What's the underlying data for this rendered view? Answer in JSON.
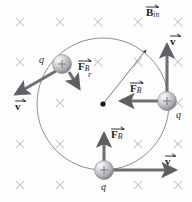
{
  "figure": {
    "background_color": "#fdfdfd",
    "field": {
      "label_symbol": "B",
      "label_subscript": "in",
      "label_full": "B_in",
      "direction": "into-page",
      "marker_glyph": "×",
      "marker_color": "#c9c9cf",
      "markers": [
        {
          "x": 20,
          "y": 22
        },
        {
          "x": 60,
          "y": 22
        },
        {
          "x": 98,
          "y": 22
        },
        {
          "x": 138,
          "y": 22
        },
        {
          "x": 178,
          "y": 22
        },
        {
          "x": 20,
          "y": 62
        },
        {
          "x": 98,
          "y": 62
        },
        {
          "x": 138,
          "y": 62
        },
        {
          "x": 178,
          "y": 62
        },
        {
          "x": 60,
          "y": 103
        },
        {
          "x": 178,
          "y": 103
        },
        {
          "x": 20,
          "y": 144
        },
        {
          "x": 60,
          "y": 144
        },
        {
          "x": 138,
          "y": 144
        },
        {
          "x": 178,
          "y": 144
        },
        {
          "x": 20,
          "y": 185
        },
        {
          "x": 60,
          "y": 185
        },
        {
          "x": 138,
          "y": 185
        },
        {
          "x": 178,
          "y": 185
        }
      ]
    },
    "orbit": {
      "center": {
        "x": 103,
        "y": 104
      },
      "radius": 66,
      "stroke_color": "#8a8a8a",
      "radius_label": "r",
      "radius_label_pos": {
        "x": 88,
        "y": 73
      },
      "radius_arrow_tip": {
        "x": 147,
        "y": 49
      }
    },
    "center_dot": {
      "x": 103,
      "y": 104,
      "radius": 2.6,
      "color": "#141414"
    },
    "particles": [
      {
        "id": "particle-top-left",
        "charge_label": "q",
        "charge_sign": "+",
        "center": {
          "x": 62,
          "y": 64
        },
        "radius": 9.5,
        "charge_label_pos": {
          "x": 39,
          "y": 58
        },
        "velocity": {
          "label": "v",
          "tip": {
            "x": 14,
            "y": 96
          },
          "label_pos": {
            "x": 17,
            "y": 102
          }
        },
        "force": {
          "label": "F",
          "sublabel": "B",
          "tip": {
            "x": 79,
            "y": 89
          },
          "label_pos": {
            "x": 79,
            "y": 62
          }
        }
      },
      {
        "id": "particle-right",
        "charge_label": "q",
        "charge_sign": "+",
        "center": {
          "x": 167,
          "y": 101
        },
        "radius": 9.5,
        "charge_label_pos": {
          "x": 175,
          "y": 112
        },
        "velocity": {
          "label": "v",
          "tip": {
            "x": 167,
            "y": 43
          },
          "label_pos": {
            "x": 170,
            "y": 37
          }
        },
        "force": {
          "label": "F",
          "sublabel": "B",
          "tip": {
            "x": 120,
            "y": 101
          },
          "label_pos": {
            "x": 131,
            "y": 84
          }
        }
      },
      {
        "id": "particle-bottom",
        "charge_label": "q",
        "charge_sign": "+",
        "center": {
          "x": 104,
          "y": 170
        },
        "radius": 9.5,
        "charge_label_pos": {
          "x": 100,
          "y": 184
        },
        "velocity": {
          "label": "v",
          "tip": {
            "x": 176,
            "y": 170
          },
          "label_pos": {
            "x": 166,
            "y": 157
          }
        },
        "force": {
          "label": "F",
          "sublabel": "B",
          "tip": {
            "x": 104,
            "y": 132
          },
          "label_pos": {
            "x": 112,
            "y": 131
          }
        }
      }
    ],
    "field_label_pos": {
      "x": 148,
      "y": 6
    },
    "colors": {
      "arrow": "#6f6f73",
      "arrow_dark": "#55555a",
      "text": "#1b1b1b",
      "orbit": "#8a8a8a",
      "sphere_light": "#f2f2f2",
      "sphere_mid": "#b8b8bc",
      "sphere_dark": "#7e7e84"
    }
  }
}
